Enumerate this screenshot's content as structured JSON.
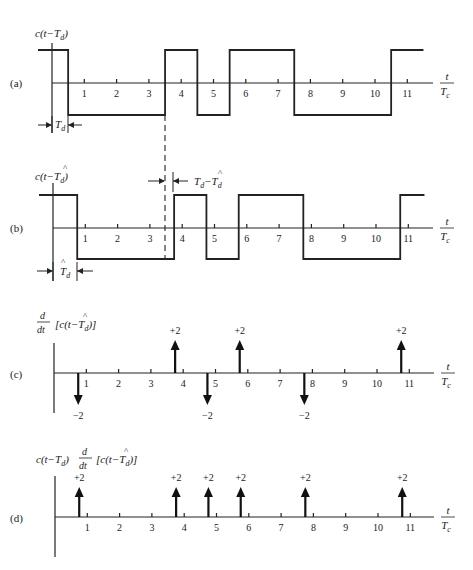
{
  "figure": {
    "x_axis": {
      "label_num": "t",
      "label_den": "T",
      "label_den_sub": "c",
      "ticks": [
        1,
        2,
        3,
        4,
        5,
        6,
        7,
        8,
        9,
        10,
        11
      ]
    },
    "panels": [
      {
        "id": "a",
        "label": "(a)",
        "ylabel": "c(t−T_d)",
        "type": "waveform",
        "levels": {
          "high": 1,
          "low": -1
        },
        "transitions": [
          0.5,
          3.5,
          4.5,
          5.5,
          7.5,
          10.5
        ],
        "start_level": 1,
        "annotation": {
          "text": "T_d",
          "desc": "delay from origin to first transition"
        }
      },
      {
        "id": "b",
        "label": "(b)",
        "ylabel": "c(t−T̂_d)",
        "type": "waveform",
        "levels": {
          "high": 1,
          "low": -1
        },
        "transitions": [
          0.75,
          3.75,
          4.75,
          5.75,
          7.75,
          10.75
        ],
        "start_level": 1,
        "annotation": {
          "text": "T̂_d",
          "offset_text": "T_d − T̂_d"
        }
      },
      {
        "id": "c",
        "label": "(c)",
        "ylabel": "d/dt [c(t−T̂_d)]",
        "type": "impulses",
        "impulses": [
          {
            "t": 0.75,
            "value": -2,
            "text": "−2"
          },
          {
            "t": 3.75,
            "value": 2,
            "text": "+2"
          },
          {
            "t": 4.75,
            "value": -2,
            "text": "−2"
          },
          {
            "t": 5.75,
            "value": 2,
            "text": "+2"
          },
          {
            "t": 7.75,
            "value": -2,
            "text": "−2"
          },
          {
            "t": 10.75,
            "value": 2,
            "text": "+2"
          }
        ]
      },
      {
        "id": "d",
        "label": "(d)",
        "ylabel": "c(t−T_d) d/dt [c(t−T̂_d)]",
        "type": "impulses",
        "impulses": [
          {
            "t": 0.75,
            "value": 2,
            "text": "+2"
          },
          {
            "t": 3.75,
            "value": 2,
            "text": "+2"
          },
          {
            "t": 4.75,
            "value": 2,
            "text": "+2"
          },
          {
            "t": 5.75,
            "value": 2,
            "text": "+2"
          },
          {
            "t": 7.75,
            "value": 2,
            "text": "+2"
          },
          {
            "t": 10.75,
            "value": 2,
            "text": "+2"
          }
        ]
      }
    ],
    "colors": {
      "ink": "#222222",
      "background": "#ffffff"
    }
  }
}
